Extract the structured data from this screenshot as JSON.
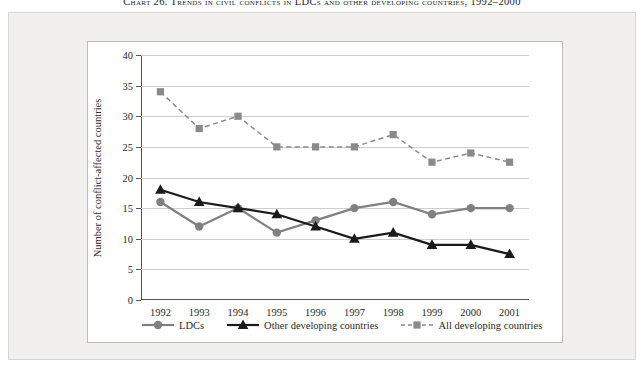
{
  "caption": {
    "prefix": "Chart 26.",
    "text": "Trends in civil conflicts in LDCs and other developing countries, 1992–2000",
    "full": "Chart 26. Trends in civil conflicts in LDCs and other developing countries, 1992–2000"
  },
  "chart_data": {
    "type": "line",
    "title": "Chart 26. Trends in civil conflicts in LDCs and other developing countries, 1992–2000",
    "xlabel": "",
    "ylabel": "Number of conflict-affected countries",
    "categories": [
      "1992",
      "1993",
      "1994",
      "1995",
      "1996",
      "1997",
      "1998",
      "1999",
      "2000",
      "2001"
    ],
    "ylim": [
      0,
      40
    ],
    "yticks": [
      0,
      5,
      10,
      15,
      20,
      25,
      30,
      35,
      40
    ],
    "grid": true,
    "legend_position": "bottom",
    "series": [
      {
        "name": "LDCs",
        "marker": "circle",
        "linestyle": "solid",
        "color": "#808080",
        "values": [
          16,
          12,
          15,
          11,
          13,
          15,
          16,
          14,
          15,
          15
        ]
      },
      {
        "name": "Other developing countries",
        "marker": "triangle",
        "linestyle": "solid",
        "color": "#1a1a1a",
        "values": [
          18,
          16,
          15,
          14,
          12,
          10,
          11,
          9,
          9,
          7.5
        ]
      },
      {
        "name": "All developing countries",
        "marker": "square",
        "linestyle": "dashed",
        "color": "#8a8a8a",
        "values": [
          34,
          28,
          30,
          25,
          25,
          25,
          27,
          22.5,
          24,
          22.5
        ]
      }
    ]
  },
  "colors": {
    "ldcs": "#808080",
    "other_developing": "#1a1a1a",
    "all_developing": "#8a8a8a",
    "grid": "#cfcecb",
    "axis": "#58544f",
    "panel_bg": "#f1f0ee",
    "card_bg": "#ffffff"
  }
}
